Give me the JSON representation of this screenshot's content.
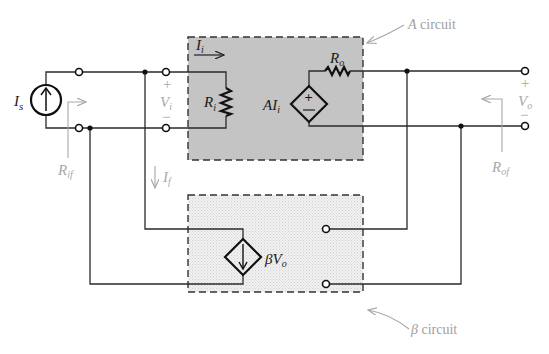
{
  "diagram": {
    "colors": {
      "a_box_fill": "#c4c4c4",
      "beta_box_fill": "#ebebeb",
      "wire": "#2a2a2a",
      "annotation_gray": "#a8a8a8"
    },
    "labels": {
      "source": "I",
      "source_sub": "s",
      "input_current": "I",
      "input_current_sub": "i",
      "input_resistance": "R",
      "input_resistance_sub": "i",
      "dependent_source": "AI",
      "dependent_source_sub": "i",
      "output_resistance": "R",
      "output_resistance_sub": "o",
      "input_voltage": "V",
      "input_voltage_sub": "i",
      "output_voltage": "V",
      "output_voltage_sub": "o",
      "feedback_current": "I",
      "feedback_current_sub": "f",
      "input_feedback_resistance": "R",
      "input_feedback_resistance_sub": "if",
      "output_feedback_resistance": "R",
      "output_feedback_resistance_sub": "of",
      "beta_source": "βV",
      "beta_source_sub": "o",
      "plus": "+",
      "minus": "−"
    },
    "captions": {
      "a_circuit": "A circuit",
      "a_circuit_letter": "A",
      "a_circuit_word": " circuit",
      "beta_circuit_letter": "β",
      "beta_circuit_word": " circuit"
    }
  }
}
